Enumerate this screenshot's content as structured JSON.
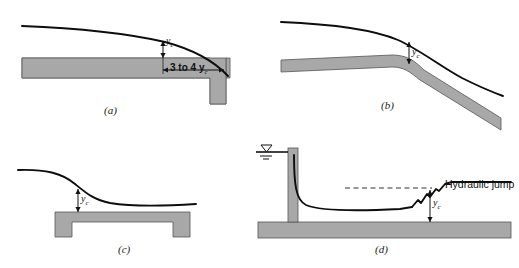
{
  "figure": {
    "colors": {
      "bed_fill": "#a8a8a8",
      "bed_stroke": "#4a4a4a",
      "surface_line": "#0d0d0d",
      "background": "#ffffff",
      "dashed_line": "#333333"
    },
    "panels": [
      {
        "id": "a",
        "label": "(a)",
        "description": "free overfall brink",
        "depth_label": "y",
        "depth_subscript": "c",
        "dimension_label": "3 to 4 y",
        "dimension_subscript": "c"
      },
      {
        "id": "b",
        "label": "(b)",
        "description": "break in bottom slope mild to steep",
        "depth_label": "y",
        "depth_subscript": "c"
      },
      {
        "id": "c",
        "label": "(c)",
        "description": "flow over a raised sill",
        "depth_label": "y",
        "depth_subscript": "c"
      },
      {
        "id": "d",
        "label": "(d)",
        "description": "sluice gate outflow with hydraulic jump",
        "depth_label": "y",
        "depth_subscript": "c",
        "annotation": "Hydraulic jump",
        "reservoir_symbol": "water-surface-triangle"
      }
    ]
  }
}
